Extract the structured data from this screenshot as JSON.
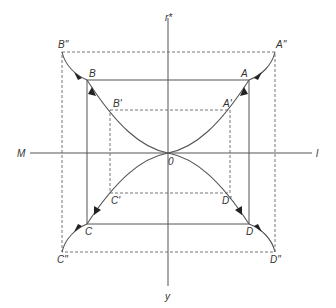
{
  "diagram": {
    "type": "phase-diagram",
    "axes": {
      "top_label": "r*",
      "bottom_label": "y",
      "left_label": "M",
      "right_label": "l",
      "origin_label": "0"
    },
    "points": {
      "outer": {
        "A": "A\"",
        "B": "B\"",
        "C": "C\"",
        "D": "D\""
      },
      "middle": {
        "A": "A",
        "B": "B",
        "C": "C",
        "D": "D"
      },
      "inner": {
        "A": "A'",
        "B": "B'",
        "C": "C'",
        "D": "D'"
      }
    },
    "rectangles": [
      {
        "name": "outer",
        "style": "dashed",
        "x": [
          62,
          275
        ],
        "y": [
          52,
          252
        ]
      },
      {
        "name": "middle",
        "style": "solid",
        "x": [
          87,
          249
        ],
        "y": [
          80,
          224
        ]
      },
      {
        "name": "inner",
        "style": "dashed",
        "x": [
          110,
          230
        ],
        "y": [
          110,
          193
        ]
      }
    ],
    "colors": {
      "line": "#555555",
      "arrow": "#222222",
      "background": "#ffffff"
    }
  }
}
